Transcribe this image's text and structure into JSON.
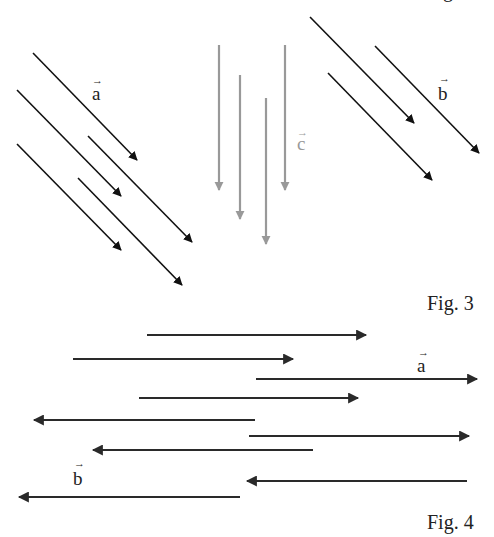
{
  "colors": {
    "dark": "#111111",
    "gray": "#999999",
    "fig4": "#2a2a2a"
  },
  "top_caption_fragment": "g",
  "fig3": {
    "caption": "Fig. 3",
    "groups": [
      {
        "name": "a",
        "label": "a",
        "color_key": "dark",
        "direction": "down-right",
        "count": 5
      },
      {
        "name": "c",
        "label": "c",
        "color_key": "gray",
        "direction": "down",
        "count": 4
      },
      {
        "name": "b",
        "label": "b",
        "color_key": "dark",
        "direction": "down-right",
        "count": 3
      }
    ]
  },
  "fig4": {
    "caption": "Fig. 4",
    "vectors": [
      {
        "direction": "right",
        "group": "a"
      },
      {
        "direction": "right",
        "group": "a"
      },
      {
        "direction": "right",
        "group": "a",
        "labeled": "a"
      },
      {
        "direction": "right",
        "group": "a"
      },
      {
        "direction": "left",
        "group": "b"
      },
      {
        "direction": "right",
        "group": "a"
      },
      {
        "direction": "left",
        "group": "b"
      },
      {
        "direction": "left",
        "group": "b"
      },
      {
        "direction": "left",
        "group": "b",
        "labeled": "b"
      }
    ]
  }
}
